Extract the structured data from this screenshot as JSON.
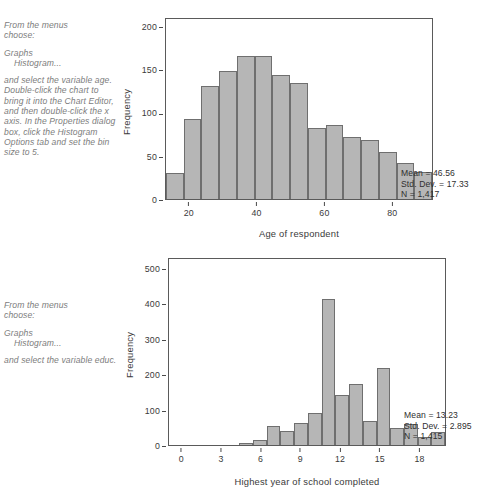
{
  "notes": {
    "age": {
      "line1": "From the menus",
      "line2": "choose:",
      "menu1": "Graphs",
      "menu2": "Histogram...",
      "body": "and select the variable age. Double-click the chart to bring it into the Chart Editor, and then double-click the x axis. In the Properties dialog box, click the Histogram Options tab and set the bin size to 5."
    },
    "educ": {
      "line1": "From the menus",
      "line2": "choose:",
      "menu1": "Graphs",
      "menu2": "Histogram...",
      "body": "and select the variable educ."
    }
  },
  "chart_data": [
    {
      "id": "age",
      "type": "bar",
      "title": "",
      "xlabel": "Age of respondent",
      "ylabel": "Frequency",
      "ylim": [
        0,
        210
      ],
      "yticks": [
        0,
        50,
        100,
        150,
        200
      ],
      "ytick_labels": [
        "0",
        "50",
        "100",
        "150",
        "200"
      ],
      "xlim": [
        13,
        92
      ],
      "xticks": [
        20,
        40,
        60,
        80
      ],
      "xtick_labels": [
        "20",
        "40",
        "60",
        "80"
      ],
      "bin_size": 5,
      "grid": false,
      "legend": "none",
      "bin_starts": [
        15,
        20,
        25,
        30,
        35,
        40,
        45,
        50,
        55,
        60,
        65,
        70,
        75,
        80,
        85
      ],
      "categories": [
        "15-20",
        "20-25",
        "25-30",
        "30-35",
        "35-40",
        "40-45",
        "45-50",
        "50-55",
        "55-60",
        "60-65",
        "65-70",
        "70-75",
        "75-80",
        "80-85",
        "85-90"
      ],
      "values": [
        30,
        92,
        130,
        148,
        165,
        165,
        143,
        134,
        82,
        85,
        72,
        68,
        54,
        41,
        31
      ],
      "annotations": {
        "mean": "Mean = 46.56",
        "std_dev": "Std. Dev. = 17.33",
        "n": "N = 1,417"
      }
    },
    {
      "id": "educ",
      "type": "bar",
      "title": "",
      "xlabel": "Highest year of school completed",
      "ylabel": "Frequency",
      "ylim": [
        0,
        530
      ],
      "yticks": [
        0,
        100,
        200,
        300,
        400,
        500
      ],
      "ytick_labels": [
        "0",
        "100",
        "200",
        "300",
        "400",
        "500"
      ],
      "xlim": [
        -1,
        20
      ],
      "xticks": [
        0,
        3,
        6,
        9,
        12,
        15,
        18
      ],
      "xtick_labels": [
        "0",
        "3",
        "6",
        "9",
        "12",
        "15",
        "18"
      ],
      "bin_size": 1,
      "grid": false,
      "legend": "none",
      "categories": [
        "0",
        "1",
        "2",
        "3",
        "4",
        "5",
        "6",
        "7",
        "8",
        "9",
        "10",
        "11",
        "12",
        "13",
        "14",
        "15",
        "16",
        "17",
        "18",
        "19",
        "20"
      ],
      "values": [
        0,
        0,
        1,
        1,
        2,
        3,
        5,
        13,
        55,
        39,
        62,
        91,
        411,
        140,
        172,
        69,
        217,
        47,
        58,
        24,
        36
      ],
      "annotations": {
        "mean": "Mean = 13.23",
        "std_dev": "Std. Dev. = 2.895",
        "n": "N = 1,415"
      }
    }
  ]
}
